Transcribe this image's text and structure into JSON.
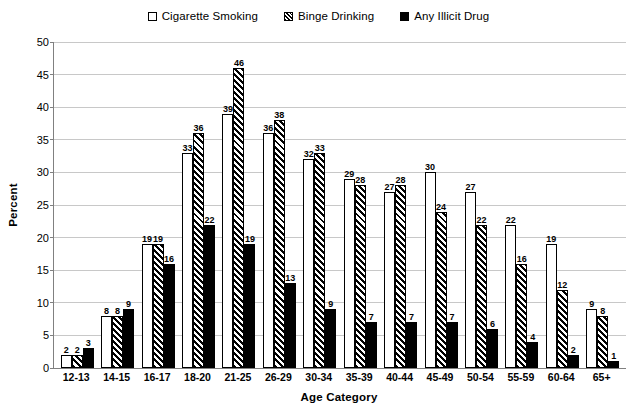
{
  "chart_data": {
    "type": "bar",
    "title": "",
    "xlabel": "Age Category",
    "ylabel": "Percent",
    "ylim": [
      0,
      50
    ],
    "yticks": [
      0,
      5,
      10,
      15,
      20,
      25,
      30,
      35,
      40,
      45,
      50
    ],
    "grid": true,
    "legend_position": "top-center",
    "categories": [
      "12-13",
      "14-15",
      "16-17",
      "18-20",
      "21-25",
      "26-29",
      "30-34",
      "35-39",
      "40-44",
      "45-49",
      "50-54",
      "55-59",
      "60-64",
      "65+"
    ],
    "series": [
      {
        "name": "Cigarette Smoking",
        "marker": "open-square",
        "fill": "white",
        "values": [
          2,
          8,
          19,
          33,
          39,
          36,
          32,
          29,
          27,
          30,
          27,
          22,
          19,
          9
        ]
      },
      {
        "name": "Binge Drinking",
        "marker": "hatched-square",
        "fill": "diagonal-hatch",
        "values": [
          2,
          8,
          19,
          36,
          46,
          38,
          33,
          28,
          28,
          24,
          22,
          16,
          12,
          8
        ]
      },
      {
        "name": "Any Illicit Drug",
        "marker": "solid-square",
        "fill": "black",
        "values": [
          3,
          9,
          16,
          22,
          19,
          13,
          9,
          7,
          7,
          7,
          6,
          4,
          2,
          1
        ]
      }
    ]
  },
  "colors": {
    "gridline": "#c8c8c8",
    "axis": "#808080",
    "bar_outline": "#000000",
    "series_cigarette": "#ffffff",
    "series_illicit": "#000000"
  }
}
